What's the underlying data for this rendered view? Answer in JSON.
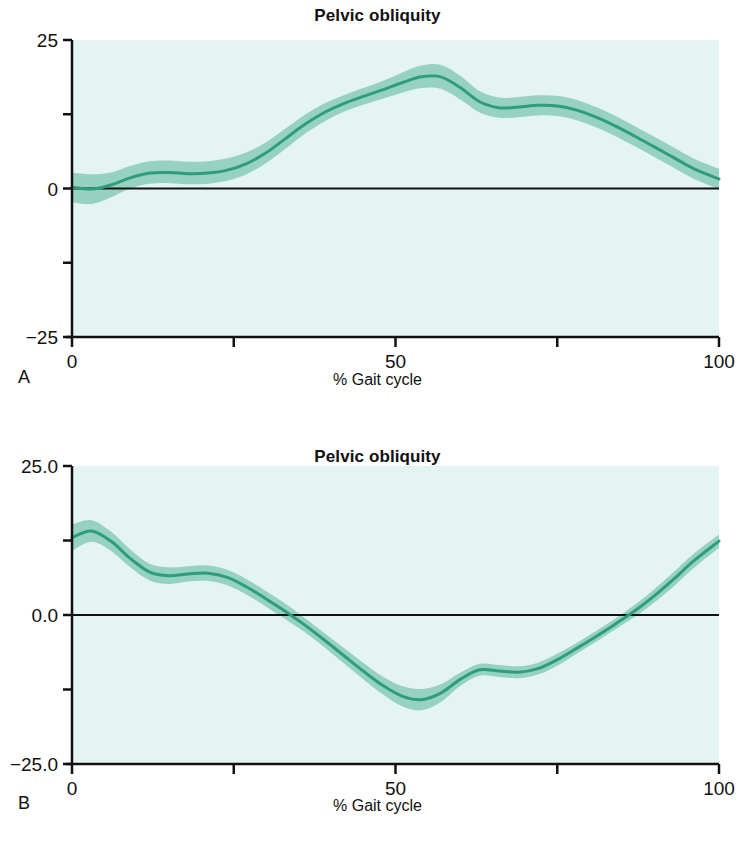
{
  "figure": {
    "panels": [
      {
        "letter": "A",
        "title": "Pelvic obliquity",
        "xlabel": "% Gait cycle",
        "ylabel": "",
        "y_ticklabels": [
          "25",
          "0",
          "-25"
        ],
        "x_ticklabels": [
          "0",
          "50",
          "100"
        ]
      },
      {
        "letter": "B",
        "title": "Pelvic obliquity",
        "xlabel": "% Gait cycle",
        "ylabel": "",
        "y_ticklabels": [
          "25.0",
          "0.0",
          "-25.0"
        ],
        "x_ticklabels": [
          "0",
          "50",
          "100"
        ]
      }
    ],
    "colors": {
      "plot_background": "#e4f4f2",
      "band": "#7cc7ae",
      "line": "#2e9d7c",
      "axis": "#111111",
      "page_background": "#ffffff"
    }
  },
  "chart_data": [
    {
      "type": "line",
      "panel": "A",
      "title": "Pelvic obliquity",
      "xlabel": "% Gait cycle",
      "ylabel": "",
      "xlim": [
        0,
        100
      ],
      "ylim": [
        -25,
        25
      ],
      "yticks": [
        25,
        12.5,
        0,
        -12.5,
        -25
      ],
      "ytick_labels": [
        "25",
        "",
        "0",
        "",
        "-25"
      ],
      "xticks": [
        0,
        25,
        50,
        75,
        100
      ],
      "xtick_labels": [
        "0",
        "",
        "50",
        "",
        "100"
      ],
      "grid": false,
      "legend": "none",
      "zero_reference_line": 0,
      "series": [
        {
          "name": "mean",
          "x": [
            0,
            3,
            6,
            9,
            12,
            15,
            18,
            21,
            24,
            27,
            30,
            33,
            36,
            39,
            42,
            45,
            48,
            51,
            54,
            57,
            60,
            63,
            66,
            69,
            72,
            75,
            78,
            81,
            84,
            87,
            90,
            93,
            96,
            100
          ],
          "values": [
            0.2,
            -0.1,
            0.6,
            1.8,
            2.6,
            2.7,
            2.5,
            2.6,
            3.1,
            4.2,
            6.0,
            8.4,
            10.8,
            12.8,
            14.3,
            15.5,
            16.6,
            17.8,
            18.8,
            18.8,
            17.0,
            14.6,
            13.6,
            13.7,
            14.0,
            13.9,
            13.2,
            12.0,
            10.5,
            8.8,
            7.0,
            5.2,
            3.4,
            1.6
          ]
        },
        {
          "name": "upper_sd",
          "x": [
            0,
            3,
            6,
            9,
            12,
            15,
            18,
            21,
            24,
            27,
            30,
            33,
            36,
            39,
            42,
            45,
            48,
            51,
            54,
            57,
            60,
            63,
            66,
            69,
            72,
            75,
            78,
            81,
            84,
            87,
            90,
            93,
            96,
            100
          ],
          "values": [
            2.7,
            2.4,
            2.7,
            3.8,
            4.6,
            4.7,
            4.5,
            4.6,
            5.1,
            6.1,
            7.8,
            10.1,
            12.4,
            14.3,
            15.7,
            16.9,
            18.1,
            19.5,
            20.7,
            20.8,
            19.0,
            16.4,
            15.3,
            15.4,
            15.7,
            15.6,
            14.9,
            13.7,
            12.2,
            10.5,
            8.7,
            6.9,
            5.1,
            3.3
          ]
        },
        {
          "name": "lower_sd",
          "x": [
            0,
            3,
            6,
            9,
            12,
            15,
            18,
            21,
            24,
            27,
            30,
            33,
            36,
            39,
            42,
            45,
            48,
            51,
            54,
            57,
            60,
            63,
            66,
            69,
            72,
            75,
            78,
            81,
            84,
            87,
            90,
            93,
            96,
            100
          ],
          "values": [
            -2.3,
            -2.6,
            -1.5,
            0.0,
            0.8,
            0.9,
            0.7,
            0.8,
            1.3,
            2.4,
            4.3,
            6.7,
            9.2,
            11.3,
            12.9,
            14.1,
            15.1,
            16.1,
            16.9,
            16.8,
            15.0,
            12.8,
            11.9,
            12.0,
            12.3,
            12.2,
            11.5,
            10.3,
            8.8,
            7.1,
            5.3,
            3.5,
            1.7,
            -0.1
          ]
        }
      ]
    },
    {
      "type": "line",
      "panel": "B",
      "title": "Pelvic obliquity",
      "xlabel": "% Gait cycle",
      "ylabel": "",
      "xlim": [
        0,
        100
      ],
      "ylim": [
        -25.0,
        25.0
      ],
      "yticks": [
        25.0,
        12.5,
        0.0,
        -12.5,
        -25.0
      ],
      "ytick_labels": [
        "25.0",
        "",
        "0.0",
        "",
        "-25.0"
      ],
      "xticks": [
        0,
        25,
        50,
        75,
        100
      ],
      "xtick_labels": [
        "0",
        "",
        "50",
        "",
        "100"
      ],
      "grid": false,
      "legend": "none",
      "zero_reference_line": 0,
      "series": [
        {
          "name": "mean",
          "x": [
            0,
            3,
            6,
            9,
            12,
            15,
            18,
            21,
            24,
            27,
            30,
            33,
            36,
            39,
            42,
            45,
            48,
            51,
            54,
            57,
            60,
            63,
            66,
            69,
            72,
            75,
            78,
            81,
            84,
            87,
            90,
            93,
            96,
            100
          ],
          "values": [
            13.0,
            14.1,
            12.4,
            9.5,
            7.2,
            6.6,
            6.9,
            7.0,
            6.3,
            4.7,
            2.7,
            0.6,
            -1.7,
            -4.2,
            -6.8,
            -9.4,
            -11.8,
            -13.6,
            -14.2,
            -13.1,
            -10.8,
            -9.2,
            -9.4,
            -9.6,
            -9.0,
            -7.5,
            -5.6,
            -3.6,
            -1.5,
            0.7,
            3.2,
            6.0,
            9.0,
            12.4
          ]
        },
        {
          "name": "upper_sd",
          "x": [
            0,
            3,
            6,
            9,
            12,
            15,
            18,
            21,
            24,
            27,
            30,
            33,
            36,
            39,
            42,
            45,
            48,
            51,
            54,
            57,
            60,
            63,
            66,
            69,
            72,
            75,
            78,
            81,
            84,
            87,
            90,
            93,
            96,
            100
          ],
          "values": [
            15.2,
            15.9,
            14.0,
            11.0,
            8.6,
            8.0,
            8.2,
            8.3,
            7.6,
            6.0,
            4.0,
            1.9,
            -0.5,
            -3.0,
            -5.5,
            -8.0,
            -10.3,
            -11.9,
            -12.4,
            -11.6,
            -9.7,
            -8.2,
            -8.4,
            -8.6,
            -8.0,
            -6.5,
            -4.7,
            -2.7,
            -0.6,
            1.7,
            4.3,
            7.2,
            10.2,
            13.5
          ]
        },
        {
          "name": "lower_sd",
          "x": [
            0,
            3,
            6,
            9,
            12,
            15,
            18,
            21,
            24,
            27,
            30,
            33,
            36,
            39,
            42,
            45,
            48,
            51,
            54,
            57,
            60,
            63,
            66,
            69,
            72,
            75,
            78,
            81,
            84,
            87,
            90,
            93,
            96,
            100
          ],
          "values": [
            10.8,
            12.3,
            10.8,
            8.0,
            5.8,
            5.2,
            5.6,
            5.7,
            5.0,
            3.4,
            1.4,
            -0.7,
            -2.9,
            -5.4,
            -8.1,
            -10.8,
            -13.3,
            -15.3,
            -16.0,
            -14.6,
            -11.9,
            -10.2,
            -10.4,
            -10.6,
            -10.0,
            -8.5,
            -6.5,
            -4.5,
            -2.4,
            -0.3,
            2.1,
            4.8,
            7.8,
            11.3
          ]
        }
      ]
    }
  ]
}
